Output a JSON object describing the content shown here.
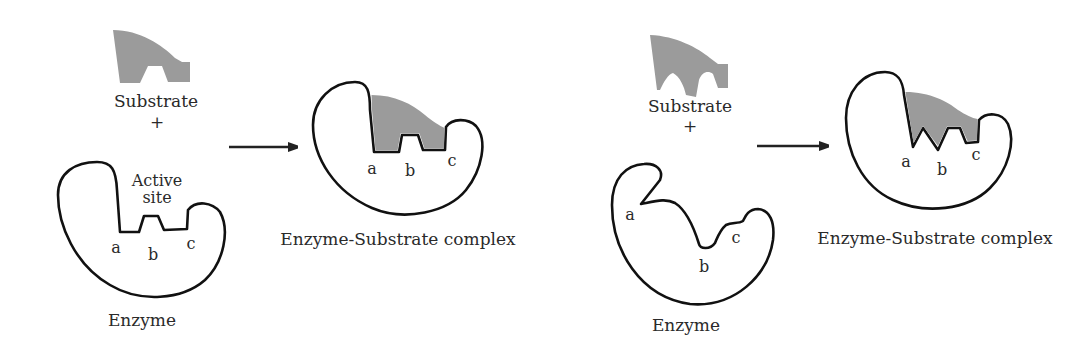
{
  "diagram": {
    "colors": {
      "background": "#ffffff",
      "outline": "#111111",
      "substrate_fill": "#9b9b9b",
      "text": "#2a2a2a"
    },
    "panel_left": {
      "model": "lock-and-key",
      "substrate_label": "Substrate",
      "plus": "+",
      "active_site_label_line1": "Active",
      "active_site_label_line2": "site",
      "enzyme_label": "Enzyme",
      "site_labels": [
        "a",
        "b",
        "c"
      ],
      "arrow": "arrow-right",
      "complex_label": "Enzyme-Substrate complex",
      "complex_site_labels": [
        "a",
        "b",
        "c"
      ]
    },
    "panel_right": {
      "model": "induced-fit",
      "substrate_label": "Substrate",
      "plus": "+",
      "enzyme_label": "Enzyme",
      "site_labels": [
        "a",
        "b",
        "c"
      ],
      "arrow": "arrow-right",
      "complex_label": "Enzyme-Substrate complex",
      "complex_site_labels": [
        "a",
        "b",
        "c"
      ]
    }
  }
}
